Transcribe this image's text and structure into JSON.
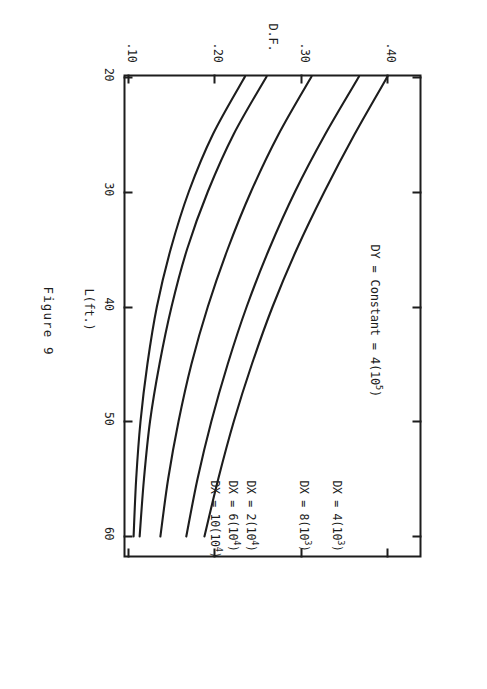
{
  "figure": {
    "caption": "Figure 9",
    "annotation": {
      "text_before": "DY = Constant = 4(10",
      "exponent": "5",
      "text_after": ")",
      "full": "DY = Constant = 4(10⁵)"
    }
  },
  "axes": {
    "x": {
      "label": "L(ft.)",
      "ticks": [
        "20",
        "30",
        "40",
        "50",
        "60"
      ],
      "values": [
        20,
        30,
        40,
        50,
        60
      ],
      "min": 20,
      "max": 62
    },
    "y": {
      "label": "D.F.",
      "ticks": [
        ".40",
        ".30",
        ".20",
        ".10"
      ],
      "values": [
        0.4,
        0.3,
        0.2,
        0.1
      ],
      "min": 0.1,
      "max": 0.445
    }
  },
  "curve_labels": [
    {
      "prefix": "DX = 4(10",
      "exponent": "3",
      "suffix": ")",
      "full": "DX = 4(10³)"
    },
    {
      "prefix": "DX = 8(10",
      "exponent": "3",
      "suffix": ")",
      "full": "DX = 8(10³)"
    },
    {
      "prefix": "DX = 2(10",
      "exponent": "4",
      "suffix": ")",
      "full": "DX = 2(10⁴)"
    },
    {
      "prefix": "DX = 6(10",
      "exponent": "4",
      "suffix": ")",
      "full": "DX = 6(10⁴)"
    },
    {
      "prefix": "DX = 10(10",
      "exponent": "4",
      "suffix": ")",
      "full": "DX = 10(10⁴)"
    }
  ],
  "colors": {
    "ink": "#1d1d1d",
    "paper": "#ffffff"
  },
  "chart_data": {
    "type": "line",
    "title": "Figure 9",
    "xlabel": "L(ft.)",
    "ylabel": "D.F.",
    "xlim": [
      20,
      62
    ],
    "ylim": [
      0.1,
      0.445
    ],
    "xticks": [
      20,
      30,
      40,
      50,
      60
    ],
    "yticks": [
      0.1,
      0.2,
      0.3,
      0.4
    ],
    "grid": false,
    "legend": "inline labels at right end of each curve",
    "annotations": [
      "DY = Constant = 4(10⁵)"
    ],
    "x": [
      20,
      25,
      30,
      35,
      40,
      45,
      50,
      55,
      60
    ],
    "series": [
      {
        "name": "DX = 4(10³)",
        "values": [
          0.408,
          0.37,
          0.335,
          0.303,
          0.275,
          0.251,
          0.23,
          0.212,
          0.196
        ]
      },
      {
        "name": "DX = 8(10³)",
        "values": [
          0.375,
          0.336,
          0.301,
          0.271,
          0.245,
          0.223,
          0.204,
          0.188,
          0.175
        ]
      },
      {
        "name": "DX = 2(10⁴)",
        "values": [
          0.32,
          0.282,
          0.25,
          0.223,
          0.2,
          0.181,
          0.166,
          0.154,
          0.145
        ]
      },
      {
        "name": "DX = 6(10⁴)",
        "values": [
          0.268,
          0.23,
          0.2,
          0.176,
          0.158,
          0.144,
          0.133,
          0.126,
          0.121
        ]
      },
      {
        "name": "DX = 10(10⁴)",
        "values": [
          0.243,
          0.206,
          0.178,
          0.157,
          0.141,
          0.13,
          0.122,
          0.117,
          0.114
        ]
      }
    ]
  }
}
